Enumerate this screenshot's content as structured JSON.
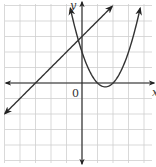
{
  "chart_data": {
    "type": "line",
    "title": "",
    "xlabel": "x",
    "ylabel": "y",
    "origin_label": "0",
    "grid": true,
    "xlim": [
      -5,
      4.7
    ],
    "ylim": [
      -5.1,
      5.3
    ],
    "grid_step": 1,
    "series": [
      {
        "name": "line",
        "equation": "y = x + 3",
        "slope": 1,
        "intercept": 3,
        "x_intercept": -3,
        "y_intercept": 3,
        "x_range": [
          -4.97,
          1.94
        ],
        "arrows": "both"
      },
      {
        "name": "parabola",
        "equation": "y = x^2 - 3x + 2",
        "a": 1,
        "b": -3,
        "c": 2,
        "vertex": [
          1.5,
          -0.25
        ],
        "x_intercepts": [
          1,
          2
        ],
        "y_intercept": 2,
        "x_range": [
          -0.75,
          3.75
        ],
        "arrows": "both"
      }
    ]
  },
  "colors": {
    "grid": "#cfcfcf",
    "axis": "#222222",
    "curve": "#333333"
  },
  "layout": {
    "origin_px": [
      82,
      83
    ],
    "unit_px": 15.5
  }
}
